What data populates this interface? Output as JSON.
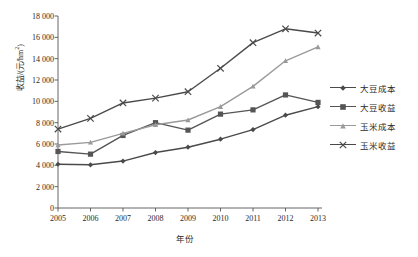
{
  "chart_data": {
    "type": "line",
    "title": "",
    "xlabel": "年份",
    "ylabel": "收益/(元/hm²)",
    "categories": [
      "2005",
      "2006",
      "2007",
      "2008",
      "2009",
      "2010",
      "2011",
      "2012",
      "2013"
    ],
    "x": [
      2005,
      2006,
      2007,
      2008,
      2009,
      2010,
      2011,
      2012,
      2013
    ],
    "ylim": [
      0,
      18000
    ],
    "yticks": [
      0,
      2000,
      4000,
      6000,
      8000,
      10000,
      12000,
      14000,
      16000,
      18000
    ],
    "ytick_labels": [
      "0",
      "2 000",
      "4 000",
      "6 000",
      "8 000",
      "10 000",
      "12 000",
      "14 000",
      "16 000",
      "18 000"
    ],
    "grid": false,
    "legend_position": "right",
    "series": [
      {
        "name": "大豆成本",
        "marker": "diamond",
        "color": "#4a4a4a",
        "values": [
          4100,
          4050,
          4400,
          5200,
          5700,
          6450,
          7350,
          8700,
          9500
        ]
      },
      {
        "name": "大豆收益",
        "marker": "square",
        "color": "#555555",
        "values": [
          5300,
          5050,
          6800,
          8000,
          7300,
          8800,
          9200,
          10600,
          9900
        ]
      },
      {
        "name": "玉米成本",
        "marker": "triangle",
        "color": "#9a9a9a",
        "values": [
          5900,
          6150,
          7000,
          7800,
          8250,
          9500,
          11400,
          13800,
          15100
        ]
      },
      {
        "name": "玉米收益",
        "marker": "cross",
        "color": "#4a4a4a",
        "values": [
          7400,
          8400,
          9850,
          10300,
          10900,
          13100,
          15500,
          16800,
          16400
        ]
      }
    ]
  },
  "axes": {
    "axis_color": "#555555"
  }
}
